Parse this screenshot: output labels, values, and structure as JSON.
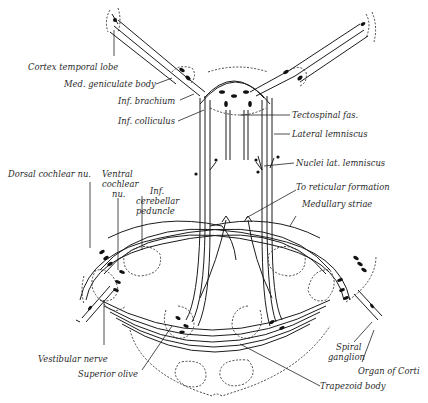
{
  "figure": {
    "type": "anatomical-diagram",
    "labels": {
      "cortex_temporal_lobe": "Cortex temporal lobe",
      "med_geniculate_body": "Med. geniculate body",
      "inf_brachium": "Inf. brachium",
      "inf_colliculus": "Inf. colliculus",
      "tectospinal_fas": "Tectospinal fas.",
      "lateral_lemniscus": "Lateral lemniscus",
      "nuclei_lat_lemniscus": "Nuclei lat. lemniscus",
      "to_reticular_formation": "To reticular formation",
      "medullary_striae": "Medullary striae",
      "dorsal_cochlear_nu": "Dorsal cochlear nu.",
      "ventral_cochlear_nu_1": "Ventral",
      "ventral_cochlear_nu_2": "cochlear",
      "ventral_cochlear_nu_3": "nu.",
      "inf_cerebellar_peduncle_1": "Inf.",
      "inf_cerebellar_peduncle_2": "cerebellar",
      "inf_cerebellar_peduncle_3": "peduncle",
      "vestibular_nerve": "Vestibular nerve",
      "superior_olive": "Superior olive",
      "spiral_ganglion_1": "Spiral",
      "spiral_ganglion_2": "ganglion",
      "organ_of_corti": "Organ of Corti",
      "trapezoid_body": "Trapezoid body"
    }
  }
}
